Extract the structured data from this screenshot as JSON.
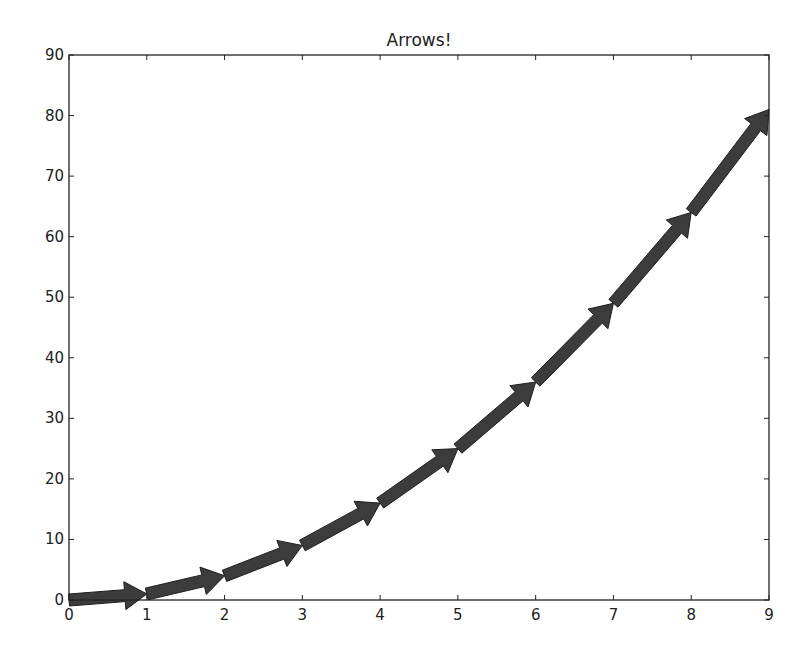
{
  "chart_data": {
    "type": "line",
    "subtype": "arrows (quiver-style arrow segments)",
    "title": "Arrows!",
    "xlabel": "",
    "ylabel": "",
    "xlim": [
      0,
      9
    ],
    "ylim": [
      0,
      90
    ],
    "xticks": [
      0,
      1,
      2,
      3,
      4,
      5,
      6,
      7,
      8,
      9
    ],
    "yticks": [
      0,
      10,
      20,
      30,
      40,
      50,
      60,
      70,
      80,
      90
    ],
    "grid": false,
    "legend": null,
    "series": [
      {
        "name": "y = x^2",
        "x": [
          0,
          1,
          2,
          3,
          4,
          5,
          6,
          7,
          8,
          9
        ],
        "y": [
          0,
          1,
          4,
          9,
          16,
          25,
          36,
          49,
          64,
          81
        ],
        "color": "#3a3a3a"
      }
    ],
    "arrows": [
      {
        "from": [
          0,
          0
        ],
        "to": [
          1,
          1
        ]
      },
      {
        "from": [
          1,
          1
        ],
        "to": [
          2,
          4
        ]
      },
      {
        "from": [
          2,
          4
        ],
        "to": [
          3,
          9
        ]
      },
      {
        "from": [
          3,
          9
        ],
        "to": [
          4,
          16
        ]
      },
      {
        "from": [
          4,
          16
        ],
        "to": [
          5,
          25
        ]
      },
      {
        "from": [
          5,
          25
        ],
        "to": [
          6,
          36
        ]
      },
      {
        "from": [
          6,
          36
        ],
        "to": [
          7,
          49
        ]
      },
      {
        "from": [
          7,
          49
        ],
        "to": [
          8,
          64
        ]
      },
      {
        "from": [
          8,
          64
        ],
        "to": [
          9,
          81
        ]
      }
    ]
  },
  "colors": {
    "arrow_fill": "#3c3c3c",
    "arrow_edge": "#1e1e1e",
    "axis": "#222222",
    "background": "#ffffff"
  }
}
